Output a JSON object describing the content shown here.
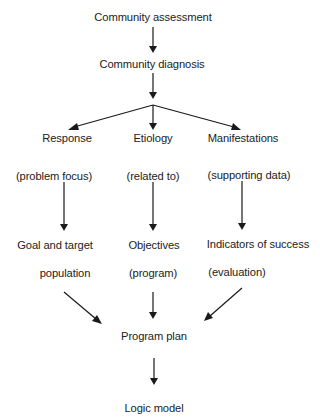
{
  "diagram": {
    "type": "flowchart",
    "nodes": {
      "assessment": "Community assessment",
      "diagnosis": "Community diagnosis",
      "response": "Response",
      "etiology": "Etiology",
      "manifestations": "Manifestations",
      "problem_focus": "(problem focus)",
      "related_to": "(related to)",
      "supporting_data": "(supporting data)",
      "goal_line1": "Goal and target",
      "goal_line2": "population",
      "objectives": "Objectives",
      "objectives_sub": "(program)",
      "indicators": "Indicators of success",
      "indicators_sub": "(evaluation)",
      "program_plan": "Program plan",
      "logic_model": "Logic model"
    },
    "edges": [
      {
        "from": "Community assessment",
        "to": "Community diagnosis"
      },
      {
        "from": "Community diagnosis",
        "to": "Response"
      },
      {
        "from": "Community diagnosis",
        "to": "Etiology"
      },
      {
        "from": "Community diagnosis",
        "to": "Manifestations"
      },
      {
        "from": "(problem focus)",
        "to": "Goal and target population"
      },
      {
        "from": "(related to)",
        "to": "Objectives"
      },
      {
        "from": "(supporting data)",
        "to": "Indicators of success"
      },
      {
        "from": "Goal and target population",
        "to": "Program plan"
      },
      {
        "from": "Objectives (program)",
        "to": "Program plan"
      },
      {
        "from": "Indicators of success (evaluation)",
        "to": "Program plan"
      },
      {
        "from": "Program plan",
        "to": "Logic model"
      }
    ],
    "colors": {
      "text": "#222222",
      "lines": "#1a1a1a",
      "background": "#ffffff"
    }
  }
}
